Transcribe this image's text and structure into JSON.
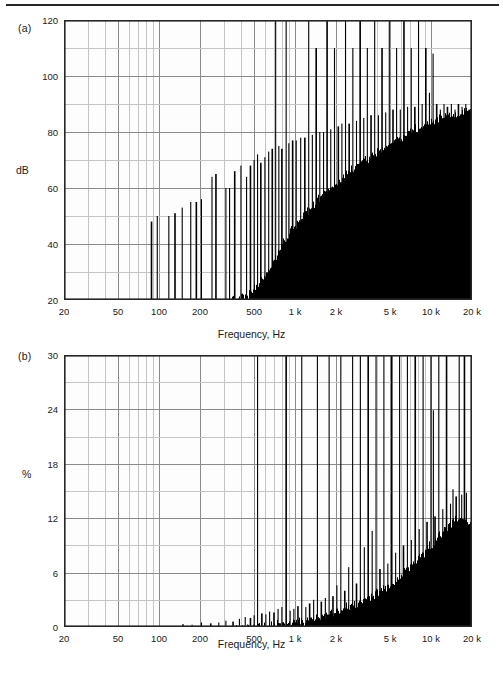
{
  "figure": {
    "panel_a_tag": "(a)",
    "panel_b_tag": "(b)",
    "xaxis_title": "Frequency, Hz",
    "yaxis_title_a": "dB",
    "yaxis_title_b": "%",
    "axis_color": "#262626",
    "grid_major_color": "#8a8a8a",
    "grid_minor_color": "#c4c4c4",
    "data_color": "#000000",
    "background_color": "#ffffff",
    "plot_background_color": "#fdfdfd"
  },
  "chart_data": [
    {
      "type": "bar",
      "id": "panel-a-spectrum",
      "title": "(a)",
      "xlabel": "Frequency, Hz",
      "ylabel": "dB",
      "xscale": "log",
      "xlim": [
        20,
        20000
      ],
      "ylim": [
        20,
        120
      ],
      "yticks": [
        20,
        40,
        60,
        80,
        100,
        120
      ],
      "ytick_labels": [
        "20",
        "40",
        "60",
        "80",
        "100",
        "120"
      ],
      "y_minor_step": 10,
      "xticks": [
        20,
        50,
        100,
        200,
        500,
        1000,
        2000,
        5000,
        10000,
        20000
      ],
      "xtick_labels": [
        "20",
        "50",
        "100",
        "200",
        "500",
        "1 k",
        "2 k",
        "5 k",
        "10 k",
        "20 k"
      ],
      "grid": true,
      "legend": "none",
      "baseline": 20,
      "noise_floor": {
        "comment": "rising noise floor in dB, breakpoints as [frequency_hz, dB]",
        "points": [
          [
            20,
            20
          ],
          [
            60,
            20
          ],
          [
            100,
            20
          ],
          [
            200,
            20
          ],
          [
            300,
            21
          ],
          [
            450,
            24
          ],
          [
            600,
            31
          ],
          [
            700,
            36
          ],
          [
            800,
            42
          ],
          [
            900,
            46
          ],
          [
            1000,
            49
          ],
          [
            1300,
            55
          ],
          [
            1600,
            60
          ],
          [
            2000,
            64
          ],
          [
            2500,
            68
          ],
          [
            3200,
            72
          ],
          [
            4000,
            75
          ],
          [
            5000,
            78
          ],
          [
            6300,
            81
          ],
          [
            8000,
            84
          ],
          [
            10000,
            86
          ],
          [
            12500,
            88
          ],
          [
            16000,
            89
          ],
          [
            20000,
            90
          ]
        ]
      },
      "harmonic_peaks": {
        "comment": "discrete spectral spikes as [frequency_hz, peak_dB]; peaks clipped at 120 are drawn full height",
        "points": [
          [
            88,
            48
          ],
          [
            97,
            50
          ],
          [
            118,
            50
          ],
          [
            131,
            51
          ],
          [
            148,
            53
          ],
          [
            171,
            55
          ],
          [
            188,
            55
          ],
          [
            205,
            56
          ],
          [
            245,
            64
          ],
          [
            262,
            65
          ],
          [
            310,
            60
          ],
          [
            330,
            60
          ],
          [
            360,
            66
          ],
          [
            400,
            68
          ],
          [
            440,
            64
          ],
          [
            470,
            68
          ],
          [
            500,
            70
          ],
          [
            530,
            72
          ],
          [
            560,
            69
          ],
          [
            600,
            71
          ],
          [
            640,
            73
          ],
          [
            680,
            74
          ],
          [
            720,
            120
          ],
          [
            760,
            75
          ],
          [
            800,
            74
          ],
          [
            860,
            120
          ],
          [
            900,
            76
          ],
          [
            960,
            77
          ],
          [
            1020,
            77
          ],
          [
            1100,
            78
          ],
          [
            1180,
            78
          ],
          [
            1260,
            120
          ],
          [
            1340,
            79
          ],
          [
            1430,
            110
          ],
          [
            1520,
            80
          ],
          [
            1620,
            80
          ],
          [
            1720,
            120
          ],
          [
            1830,
            81
          ],
          [
            1950,
            110
          ],
          [
            2080,
            82
          ],
          [
            2210,
            83
          ],
          [
            2350,
            120
          ],
          [
            2500,
            83
          ],
          [
            2660,
            110
          ],
          [
            2830,
            84
          ],
          [
            3010,
            120
          ],
          [
            3200,
            85
          ],
          [
            3400,
            110
          ],
          [
            3620,
            86
          ],
          [
            3850,
            120
          ],
          [
            4100,
            86
          ],
          [
            4360,
            110
          ],
          [
            4640,
            87
          ],
          [
            4930,
            120
          ],
          [
            5250,
            88
          ],
          [
            5580,
            110
          ],
          [
            5940,
            88
          ],
          [
            6320,
            120
          ],
          [
            6720,
            89
          ],
          [
            7150,
            110
          ],
          [
            7600,
            89
          ],
          [
            8090,
            120
          ],
          [
            8600,
            90
          ],
          [
            9150,
            110
          ],
          [
            9730,
            94
          ],
          [
            10350,
            108
          ],
          [
            11000,
            90
          ],
          [
            11700,
            88
          ],
          [
            12450,
            90
          ],
          [
            13200,
            89
          ],
          [
            14100,
            90
          ],
          [
            15000,
            88
          ],
          [
            15900,
            90
          ],
          [
            16900,
            89
          ],
          [
            18000,
            90
          ],
          [
            19100,
            88
          ],
          [
            19900,
            90
          ]
        ]
      }
    },
    {
      "type": "bar",
      "id": "panel-b-distortion",
      "title": "(b)",
      "xlabel": "Frequency, Hz",
      "ylabel": "%",
      "xscale": "log",
      "xlim": [
        20,
        20000
      ],
      "ylim": [
        0,
        30
      ],
      "yticks": [
        0,
        6,
        12,
        18,
        24,
        30
      ],
      "ytick_labels": [
        "0",
        "6",
        "12",
        "18",
        "24",
        "30"
      ],
      "y_minor_step": 3,
      "xticks": [
        20,
        50,
        100,
        200,
        500,
        1000,
        2000,
        5000,
        10000,
        20000
      ],
      "xtick_labels": [
        "20",
        "50",
        "100",
        "200",
        "500",
        "1 k",
        "2 k",
        "5 k",
        "10 k",
        "20 k"
      ],
      "grid": true,
      "legend": "none",
      "baseline": 0,
      "noise_floor": {
        "comment": "rising distortion envelope in percent, breakpoints as [frequency_hz, percent]",
        "points": [
          [
            20,
            0
          ],
          [
            100,
            0
          ],
          [
            150,
            0.1
          ],
          [
            200,
            0.15
          ],
          [
            300,
            0.25
          ],
          [
            400,
            0.4
          ],
          [
            500,
            0.6
          ],
          [
            650,
            0.8
          ],
          [
            800,
            1.0
          ],
          [
            1000,
            1.2
          ],
          [
            1300,
            1.5
          ],
          [
            1600,
            1.9
          ],
          [
            2000,
            2.3
          ],
          [
            2500,
            2.9
          ],
          [
            3200,
            3.6
          ],
          [
            4000,
            4.4
          ],
          [
            5000,
            5.4
          ],
          [
            6300,
            6.6
          ],
          [
            8000,
            8.2
          ],
          [
            10000,
            9.8
          ],
          [
            12500,
            11.4
          ],
          [
            14000,
            12.2
          ],
          [
            16000,
            12.6
          ],
          [
            18000,
            12.4
          ],
          [
            20000,
            12.0
          ]
        ]
      },
      "harmonic_peaks": {
        "comment": "discrete distortion spikes as [frequency_hz, percent]; peaks at or above 30 are clipped",
        "points": [
          [
            150,
            0.3
          ],
          [
            175,
            0.25
          ],
          [
            205,
            0.5
          ],
          [
            240,
            0.4
          ],
          [
            275,
            0.5
          ],
          [
            310,
            0.7
          ],
          [
            350,
            0.6
          ],
          [
            390,
            0.9
          ],
          [
            430,
            1.1
          ],
          [
            470,
            1.0
          ],
          [
            500,
            1.3
          ],
          [
            530,
            30
          ],
          [
            570,
            1.5
          ],
          [
            610,
            1.4
          ],
          [
            650,
            1.7
          ],
          [
            700,
            1.6
          ],
          [
            750,
            2.0
          ],
          [
            800,
            2.2
          ],
          [
            860,
            30
          ],
          [
            920,
            1.8
          ],
          [
            980,
            2.0
          ],
          [
            1050,
            2.3
          ],
          [
            1120,
            30
          ],
          [
            1200,
            2.2
          ],
          [
            1280,
            2.6
          ],
          [
            1370,
            3.0
          ],
          [
            1460,
            30
          ],
          [
            1560,
            2.8
          ],
          [
            1670,
            3.2
          ],
          [
            1780,
            30
          ],
          [
            1900,
            3.4
          ],
          [
            2030,
            4.6
          ],
          [
            2170,
            30
          ],
          [
            2320,
            4.0
          ],
          [
            2480,
            6.6
          ],
          [
            2650,
            30
          ],
          [
            2830,
            4.8
          ],
          [
            3020,
            30
          ],
          [
            3230,
            8.8
          ],
          [
            3450,
            30
          ],
          [
            3690,
            10.6
          ],
          [
            3940,
            30
          ],
          [
            4210,
            6.4
          ],
          [
            4500,
            30
          ],
          [
            4810,
            7.0
          ],
          [
            5140,
            30
          ],
          [
            5490,
            8.2
          ],
          [
            5870,
            30
          ],
          [
            6270,
            9.0
          ],
          [
            6700,
            30
          ],
          [
            7160,
            9.6
          ],
          [
            7650,
            30
          ],
          [
            8180,
            10.8
          ],
          [
            8740,
            30
          ],
          [
            9340,
            11.6
          ],
          [
            9980,
            30
          ],
          [
            10400,
            23.9
          ],
          [
            10700,
            12.2
          ],
          [
            11400,
            30
          ],
          [
            12200,
            13.0
          ],
          [
            13000,
            30
          ],
          [
            13900,
            13.6
          ],
          [
            14500,
            15.2
          ],
          [
            15300,
            14.4
          ],
          [
            16100,
            30
          ],
          [
            16800,
            14.6
          ],
          [
            17600,
            30
          ],
          [
            18200,
            14.8
          ],
          [
            19000,
            3.8
          ],
          [
            19600,
            4.0
          ],
          [
            19900,
            3.2
          ]
        ]
      }
    }
  ],
  "layout": {
    "plot_a": {
      "left": 64,
      "top": 20,
      "width": 408,
      "height": 280
    },
    "plot_b": {
      "left": 64,
      "top": 355,
      "width": 408,
      "height": 272
    }
  }
}
